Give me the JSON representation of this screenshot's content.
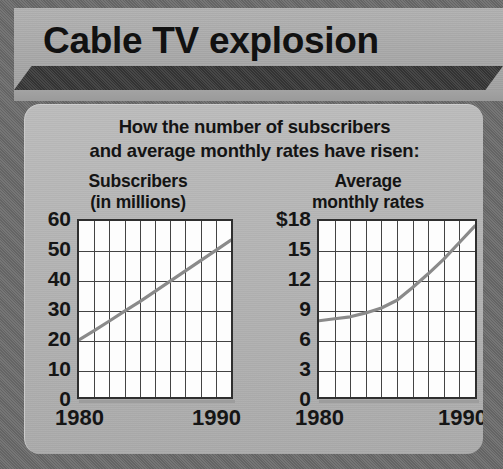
{
  "header": {
    "title": "Cable TV explosion"
  },
  "subtitle": {
    "line1": "How the number of subscribers",
    "line2": "and average monthly rates have risen:"
  },
  "colors": {
    "background": "#8e8e8e",
    "panel": "#b4b4b4",
    "header_band": "#3a3a3a",
    "plot_background": "#fdfdfd",
    "grid": "#434343",
    "data_line": "#8a8a8a",
    "text": "#141414"
  },
  "chart_data": [
    {
      "type": "line",
      "id": "subscribers",
      "title_line1": "Subscribers",
      "title_line2": "(in millions)",
      "xlabel": "",
      "ylabel": "",
      "xlim": [
        1980,
        1990
      ],
      "ylim": [
        0,
        60
      ],
      "xticks": [
        "1980",
        "1990"
      ],
      "yticks": [
        "60",
        "50",
        "40",
        "30",
        "20",
        "10",
        "0"
      ],
      "ytick_values": [
        60,
        50,
        40,
        30,
        20,
        10,
        0
      ],
      "grid": true,
      "grid_columns": 10,
      "legend": "none",
      "x": [
        1980,
        1981,
        1982,
        1983,
        1984,
        1985,
        1986,
        1987,
        1988,
        1989,
        1990
      ],
      "values": [
        19.5,
        22.6,
        25.9,
        29.3,
        32.5,
        36.0,
        39.5,
        43.0,
        46.5,
        50.0,
        53.5
      ]
    },
    {
      "type": "line",
      "id": "average-monthly-rates",
      "title_line1": "Average",
      "title_line2": "monthly rates",
      "xlabel": "",
      "ylabel": "",
      "xlim": [
        1980,
        1990
      ],
      "ylim": [
        0,
        18
      ],
      "xticks": [
        "1980",
        "1990"
      ],
      "yticks": [
        "$18",
        "15",
        "12",
        "9",
        "6",
        "3",
        "0"
      ],
      "ytick_values": [
        18,
        15,
        12,
        9,
        6,
        3,
        0
      ],
      "grid": true,
      "grid_columns": 10,
      "legend": "none",
      "x": [
        1980,
        1981,
        1982,
        1983,
        1984,
        1985,
        1986,
        1987,
        1988,
        1989,
        1990
      ],
      "values": [
        7.8,
        8.0,
        8.2,
        8.6,
        9.1,
        9.9,
        11.2,
        12.6,
        14.1,
        15.8,
        17.5
      ]
    }
  ]
}
